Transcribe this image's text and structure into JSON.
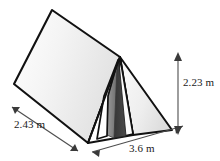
{
  "figure": {
    "name": "triangular-prism-tent-diagram",
    "background_color": "#ffffff",
    "outline_color": "#000000",
    "panel_fill_light": "#f2f2f2",
    "panel_fill_mid": "#e4e4e4",
    "panel_fill_white": "#ffffff",
    "interior_dark": "#3b3b3b",
    "interior_mid": "#8a8a8a"
  },
  "dimensions": [
    {
      "id": "slant",
      "value": "2.43",
      "unit": "m",
      "label": "2.43 m",
      "edge": "left-lower-slanted-edge",
      "arrow": "double-headed",
      "orientation": "diagonal"
    },
    {
      "id": "length",
      "value": "3.6",
      "unit": "m",
      "label": "3.6 m",
      "edge": "bottom-front-edge",
      "arrow": "double-headed",
      "orientation": "diagonal"
    },
    {
      "id": "height",
      "value": "2.23",
      "unit": "m",
      "label": "2.23 m",
      "edge": "right-vertical-height",
      "arrow": "double-headed",
      "orientation": "vertical"
    }
  ],
  "shapes": {
    "roof_panel_back": "large light-grey quadrilateral forming the left/back sloping roof",
    "roof_panel_front_right": "triangular right-hand sloping face",
    "front_triangle": "open triangular entrance at the front of the tent",
    "door_flaps": "two white/grey folded flaps beside the dark opening",
    "opening": "dark interior visible through the entrance"
  }
}
